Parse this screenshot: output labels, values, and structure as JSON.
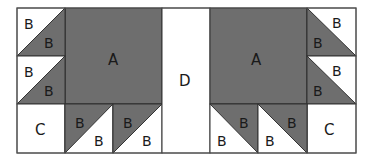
{
  "diagram": {
    "type": "quilt-block-layout",
    "colors": {
      "dark": "#6e6e6e",
      "light": "#ffffff",
      "line": "#333333"
    },
    "pieces": {
      "A": {
        "label": "A",
        "description": "large dark square",
        "count": 2
      },
      "B": {
        "label": "B",
        "description": "half-square triangle",
        "count": 16
      },
      "C": {
        "label": "C",
        "description": "light square",
        "count": 2
      },
      "D": {
        "label": "D",
        "description": "light center strip",
        "count": 1
      }
    },
    "labels": {
      "a": "A",
      "b": "B",
      "c": "C",
      "d": "D"
    }
  }
}
